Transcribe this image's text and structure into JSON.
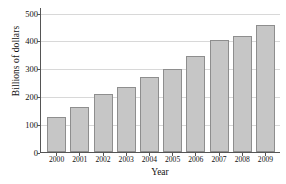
{
  "chart_data": {
    "type": "bar",
    "title": "",
    "xlabel": "Year",
    "ylabel": "Billions of dollars",
    "categories": [
      "2000",
      "2001",
      "2002",
      "2003",
      "2004",
      "2005",
      "2006",
      "2007",
      "2008",
      "2009"
    ],
    "values": [
      125,
      162,
      207,
      233,
      268,
      296,
      343,
      402,
      417,
      454
    ],
    "ylim": [
      0,
      520
    ],
    "yticks": [
      0,
      100,
      200,
      300,
      400,
      500
    ],
    "ytick_labels": [
      "0",
      "100",
      "200",
      "300",
      "400",
      "500"
    ],
    "grid": "horizontal",
    "legend": "none",
    "bar_fill_color": "#c6c6c6",
    "bar_edge_color": "#8e8e8e",
    "gridline_color": "#d8d8d8",
    "axis_color": "#555555",
    "background_color": "#ffffff"
  }
}
